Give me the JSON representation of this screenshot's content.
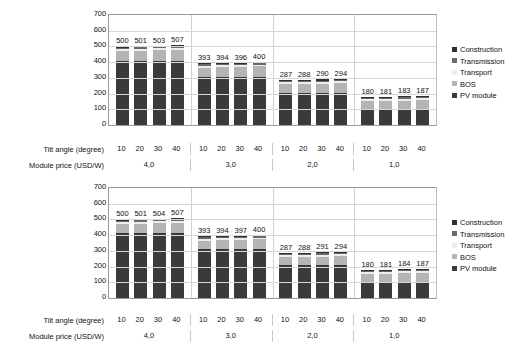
{
  "chart_data": [
    {
      "type": "bar",
      "id": "top-chart",
      "stacked": true,
      "title": "",
      "xlabel": "",
      "ylabel": "",
      "ylim": [
        0,
        700
      ],
      "yticks": [
        0,
        100,
        200,
        300,
        400,
        500,
        600,
        700
      ],
      "grid": true,
      "legend_position": "right",
      "categories": [
        "10",
        "20",
        "30",
        "40",
        "10",
        "20",
        "30",
        "40",
        "10",
        "20",
        "30",
        "40",
        "10",
        "20",
        "30",
        "40"
      ],
      "group_labels": [
        "4,0",
        "3,0",
        "2,0",
        "1,0"
      ],
      "totals": [
        500,
        501,
        503,
        507,
        393,
        394,
        396,
        400,
        287,
        288,
        290,
        294,
        180,
        181,
        183,
        187
      ],
      "series": [
        {
          "name": "PV module",
          "color": "#3a3a3a",
          "values": [
            410,
            410,
            410,
            410,
            307,
            307,
            307,
            307,
            205,
            205,
            205,
            205,
            96,
            96,
            96,
            96
          ]
        },
        {
          "name": "BOS",
          "color": "#b4b4b4",
          "values": [
            63,
            64,
            66,
            70,
            59,
            60,
            62,
            66,
            55,
            56,
            58,
            62,
            57,
            58,
            60,
            64
          ]
        },
        {
          "name": "Transport",
          "color": "#ededed",
          "values": [
            12,
            12,
            12,
            12,
            12,
            12,
            12,
            12,
            12,
            12,
            12,
            12,
            12,
            12,
            12,
            12
          ]
        },
        {
          "name": "Transmission",
          "color": "#696969",
          "values": [
            8,
            8,
            8,
            8,
            8,
            8,
            8,
            8,
            8,
            8,
            8,
            8,
            8,
            8,
            8,
            8
          ]
        },
        {
          "name": "Construction",
          "color": "#2e2e2e",
          "values": [
            7,
            7,
            7,
            7,
            7,
            7,
            7,
            7,
            7,
            7,
            7,
            7,
            7,
            7,
            7,
            7
          ]
        }
      ]
    },
    {
      "type": "bar",
      "id": "bottom-chart",
      "stacked": true,
      "title": "",
      "xlabel": "",
      "ylabel": "",
      "ylim": [
        0,
        700
      ],
      "yticks": [
        0,
        100,
        200,
        300,
        400,
        500,
        600,
        700
      ],
      "grid": true,
      "legend_position": "right",
      "categories": [
        "10",
        "20",
        "30",
        "40",
        "10",
        "20",
        "30",
        "40",
        "10",
        "20",
        "30",
        "40",
        "10",
        "20",
        "30",
        "40"
      ],
      "group_labels": [
        "4,0",
        "3,0",
        "2,0",
        "1,0"
      ],
      "totals": [
        500,
        501,
        504,
        507,
        393,
        394,
        397,
        400,
        287,
        288,
        291,
        294,
        180,
        181,
        184,
        187
      ],
      "series": [
        {
          "name": "PV module",
          "color": "#3a3a3a",
          "values": [
            415,
            415,
            415,
            415,
            311,
            311,
            311,
            311,
            208,
            208,
            208,
            208,
            101,
            101,
            101,
            101
          ]
        },
        {
          "name": "BOS",
          "color": "#b4b4b4",
          "values": [
            58,
            59,
            62,
            65,
            55,
            56,
            59,
            62,
            52,
            53,
            56,
            59,
            52,
            53,
            56,
            59
          ]
        },
        {
          "name": "Transport",
          "color": "#ededed",
          "values": [
            12,
            12,
            12,
            12,
            12,
            12,
            12,
            12,
            12,
            12,
            12,
            12,
            12,
            12,
            12,
            12
          ]
        },
        {
          "name": "Transmission",
          "color": "#696969",
          "values": [
            8,
            8,
            8,
            8,
            8,
            8,
            8,
            8,
            8,
            8,
            8,
            8,
            8,
            8,
            8,
            8
          ]
        },
        {
          "name": "Construction",
          "color": "#2e2e2e",
          "values": [
            7,
            7,
            7,
            7,
            7,
            7,
            7,
            7,
            7,
            7,
            7,
            7,
            7,
            7,
            7,
            7
          ]
        }
      ]
    }
  ],
  "legend": {
    "items": [
      {
        "label": "Construction",
        "color": "#2e2e2e"
      },
      {
        "label": "Transmission",
        "color": "#696969"
      },
      {
        "label": "Transport",
        "color": "#ededed"
      },
      {
        "label": "BOS",
        "color": "#b4b4b4"
      },
      {
        "label": "PV module",
        "color": "#3a3a3a"
      }
    ]
  },
  "axis_rows": {
    "tilt_angle_label": "Tilt angle (degree)",
    "module_price_label": "Module price (USD/W)",
    "tilt_values": [
      "10",
      "20",
      "30",
      "40",
      "10",
      "20",
      "30",
      "40",
      "10",
      "20",
      "30",
      "40",
      "10",
      "20",
      "30",
      "40"
    ],
    "price_values": [
      "4,0",
      "3,0",
      "2,0",
      "1,0"
    ]
  }
}
